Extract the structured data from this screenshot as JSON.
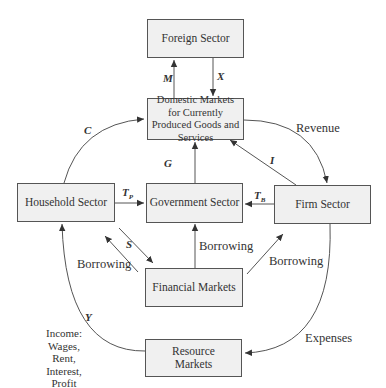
{
  "nodes": {
    "foreign": {
      "label": "Foreign Sector"
    },
    "domestic": {
      "label": "Domestic Markets for Currently Produced Goods and Services"
    },
    "household": {
      "label": "Household Sector"
    },
    "government": {
      "label": "Government Sector"
    },
    "firm": {
      "label": "Firm Sector"
    },
    "financial": {
      "label": "Financial Markets"
    },
    "resource": {
      "label": "Resource Markets"
    }
  },
  "flows": {
    "imports": {
      "symbol": "M"
    },
    "exports": {
      "symbol": "X"
    },
    "consumption": {
      "symbol": "C"
    },
    "government_spending": {
      "symbol": "G"
    },
    "investment": {
      "symbol": "I"
    },
    "revenue": {
      "label": "Revenue"
    },
    "personal_taxes": {
      "symbol": "T",
      "subscript": "P"
    },
    "business_taxes": {
      "symbol": "T",
      "subscript": "B"
    },
    "saving": {
      "symbol": "S"
    },
    "household_borrowing": {
      "label": "Borrowing"
    },
    "government_borrowing": {
      "label": "Borrowing"
    },
    "firm_borrowing": {
      "label": "Borrowing"
    },
    "income": {
      "symbol": "Y",
      "label_lines": [
        "Income:",
        "Wages,",
        "Rent,",
        "Interest,",
        "Profit"
      ]
    },
    "expenses": {
      "label": "Expenses"
    }
  },
  "colors": {
    "box_fill": "#f0f0f0",
    "box_border": "#555555",
    "line": "#444444"
  }
}
